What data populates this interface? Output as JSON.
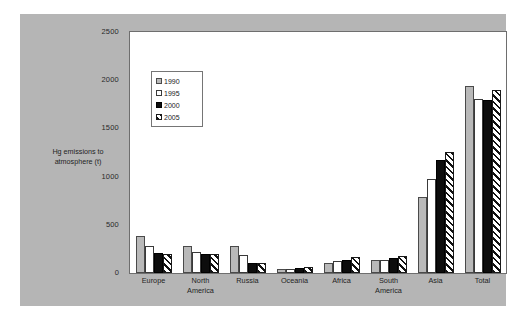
{
  "chart_data": {
    "type": "bar",
    "title": "",
    "subtitle": "",
    "xlabel": "",
    "ylabel": "Hg emissions to\natmosphere (t)",
    "ylabel_line1": "Hg emissions to",
    "ylabel_line2": "atmosphere (t)",
    "ylim": [
      0,
      2500
    ],
    "yticks": [
      0,
      500,
      1000,
      1500,
      2000,
      2500
    ],
    "ytick_labels": [
      "0",
      "500",
      "1000",
      "1500",
      "2000",
      "2500"
    ],
    "grid": false,
    "legend_position": "upper-left-inside",
    "categories": [
      "Europe",
      "North America",
      "Russia",
      "Oceania",
      "Africa",
      "South America",
      "Asia",
      "Total"
    ],
    "category_labels": [
      [
        "Europe"
      ],
      [
        "North",
        "America"
      ],
      [
        "Russia"
      ],
      [
        "Oceania"
      ],
      [
        "Africa"
      ],
      [
        "South",
        "America"
      ],
      [
        "Asia"
      ],
      [
        "Total"
      ]
    ],
    "series": [
      {
        "name": "1990",
        "swatch": "grey-fill",
        "color": "#b9b9b9",
        "values": [
          385,
          280,
          280,
          45,
          105,
          135,
          790,
          1945
        ]
      },
      {
        "name": "1995",
        "swatch": "white-fill",
        "color": "#ffffff",
        "values": [
          280,
          215,
          190,
          45,
          125,
          140,
          975,
          1800
        ]
      },
      {
        "name": "2000",
        "swatch": "black-fill",
        "color": "#0d0d0d",
        "values": [
          205,
          195,
          100,
          55,
          140,
          160,
          1170,
          1795
        ]
      },
      {
        "name": "2005",
        "swatch": "hatched-fill",
        "color": "#1a1a1a",
        "values": [
          200,
          195,
          105,
          60,
          165,
          180,
          1255,
          1900
        ]
      }
    ]
  },
  "figure": {
    "frame_color": "#b5b5b5",
    "panel_color": "#ffffff",
    "axis_color": "#6e6e6e",
    "page_background": "#ffffff"
  }
}
